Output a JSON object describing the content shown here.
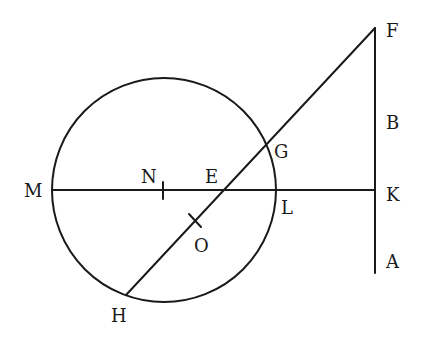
{
  "diagram": {
    "type": "geometry-figure",
    "circle": {
      "cx": 164,
      "cy": 190,
      "r": 112
    },
    "segments": [
      {
        "name": "MK",
        "from": "M",
        "to": "K"
      },
      {
        "name": "FA",
        "from": "F",
        "to": "A"
      },
      {
        "name": "FH",
        "from": "F",
        "to": "H"
      }
    ],
    "points": {
      "M": {
        "label": "M"
      },
      "N": {
        "label": "N"
      },
      "E": {
        "label": "E"
      },
      "O": {
        "label": "O"
      },
      "G": {
        "label": "G"
      },
      "L": {
        "label": "L"
      },
      "H": {
        "label": "H"
      },
      "F": {
        "label": "F"
      },
      "B": {
        "label": "B"
      },
      "K": {
        "label": "K"
      },
      "A": {
        "label": "A"
      }
    },
    "tick_marks": [
      "N",
      "O"
    ],
    "colors": {
      "line": "#1a1a1a",
      "background": "#ffffff"
    }
  }
}
